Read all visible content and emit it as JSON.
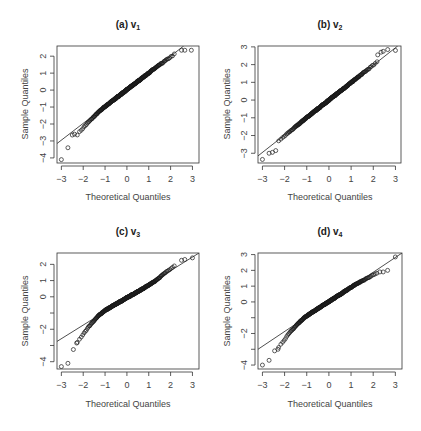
{
  "figure": {
    "panels": [
      {
        "id": "a",
        "title": "(a) v",
        "title_sub": "1",
        "xlabel": "Theoretical Quantiles",
        "ylabel": "Sample Quantiles",
        "box": {
          "x0": 57,
          "y0": 46,
          "x1": 199,
          "y1": 163
        },
        "xlim": [
          -3.2,
          3.3
        ],
        "ylim": [
          -4.3,
          2.6
        ],
        "xticks": [
          -3,
          -2,
          -1,
          0,
          1,
          2,
          3
        ],
        "xticklabels": [
          "-3",
          "-2",
          "-1",
          "0",
          "1",
          "2",
          "3"
        ],
        "yticks": [
          -4,
          -3,
          -2,
          -1,
          0,
          1,
          2
        ],
        "yticklabels": [
          "-4",
          "-3",
          "-2",
          "-1",
          "0",
          "1",
          "2"
        ],
        "line": {
          "x": [
            -3.2,
            2.6
          ],
          "y": [
            -3.15,
            2.6
          ]
        },
        "title_pos": [
          128,
          28
        ],
        "xlabel_pos": [
          128,
          200
        ],
        "ylabel_pos": [
          26,
          104
        ]
      },
      {
        "id": "b",
        "title": "(b) v",
        "title_sub": "2",
        "xlabel": "Theoretical Quantiles",
        "ylabel": "Sample Quantiles",
        "box": {
          "x0": 258,
          "y0": 46,
          "x1": 401,
          "y1": 163
        },
        "xlim": [
          -3.2,
          3.25
        ],
        "ylim": [
          -3.55,
          3.05
        ],
        "xticks": [
          -3,
          -2,
          -1,
          0,
          1,
          2,
          3
        ],
        "xticklabels": [
          "-3",
          "-2",
          "-1",
          "0",
          "1",
          "2",
          "3"
        ],
        "yticks": [
          -3,
          -2,
          -1,
          0,
          1,
          2,
          3
        ],
        "yticklabels": [
          "-3",
          "-2",
          "-1",
          "0",
          "1",
          "2",
          "3"
        ],
        "line": {
          "x": [
            -3.2,
            3.1
          ],
          "y": [
            -3.15,
            3.05
          ]
        },
        "title_pos": [
          330,
          28
        ],
        "xlabel_pos": [
          330,
          200
        ],
        "ylabel_pos": [
          228,
          104
        ]
      },
      {
        "id": "c",
        "title": "(c) v",
        "title_sub": "3",
        "xlabel": "Theoretical Quantiles",
        "ylabel": "Sample Quantiles",
        "box": {
          "x0": 57,
          "y0": 253,
          "x1": 199,
          "y1": 369
        },
        "xlim": [
          -3.2,
          3.3
        ],
        "ylim": [
          -4.45,
          2.7
        ],
        "xticks": [
          -3,
          -2,
          -1,
          0,
          1,
          2,
          3
        ],
        "xticklabels": [
          "-3",
          "-2",
          "-1",
          "0",
          "1",
          "2",
          "3"
        ],
        "yticks": [
          -4,
          -3,
          -2,
          -1,
          0,
          1,
          2
        ],
        "yticklabels": [
          "-4",
          "",
          "-2",
          "",
          "0",
          "1",
          "2"
        ],
        "line": {
          "x": [
            -3.2,
            3.3
          ],
          "y": [
            -2.75,
            2.7
          ]
        },
        "title_pos": [
          128,
          235
        ],
        "xlabel_pos": [
          128,
          407
        ],
        "ylabel_pos": [
          26,
          311
        ]
      },
      {
        "id": "d",
        "title": "(d) v",
        "title_sub": "4",
        "xlabel": "Theoretical Quantiles",
        "ylabel": "Sample Quantiles",
        "box": {
          "x0": 258,
          "y0": 253,
          "x1": 402,
          "y1": 369
        },
        "xlim": [
          -3.2,
          3.3
        ],
        "ylim": [
          -4.25,
          3.1
        ],
        "xticks": [
          -3,
          -2,
          -1,
          0,
          1,
          2,
          3
        ],
        "xticklabels": [
          "-3",
          "-2",
          "-1",
          "0",
          "1",
          "2",
          "3"
        ],
        "yticks": [
          -4,
          -3,
          -2,
          -1,
          0,
          1,
          2,
          3
        ],
        "yticklabels": [
          "-4",
          "",
          "-2",
          "",
          "0",
          "1",
          "2",
          "3"
        ],
        "line": {
          "x": [
            -3.2,
            3.3
          ],
          "y": [
            -3.0,
            3.1
          ]
        },
        "title_pos": [
          330,
          235
        ],
        "xlabel_pos": [
          330,
          407
        ],
        "ylabel_pos": [
          228,
          311
        ]
      }
    ]
  },
  "chart_data": [
    {
      "type": "scatter",
      "subtype": "qq-plot",
      "title": "(a) v₁",
      "xlabel": "Theoretical Quantiles",
      "ylabel": "Sample Quantiles",
      "xlim": [
        -3.2,
        3.3
      ],
      "ylim": [
        -4.3,
        2.6
      ],
      "xticks": [
        -3,
        -2,
        -1,
        0,
        1,
        2,
        3
      ],
      "yticks": [
        -4,
        -3,
        -2,
        -1,
        0,
        1,
        2
      ],
      "grid": false,
      "reference_line": {
        "slope": 0.99,
        "intercept": 0.02
      },
      "shape_params": {
        "lower_tail": 0.45,
        "upper_tail": -0.1,
        "mid_curve": 0.0
      },
      "outliers": [
        [
          -3.0,
          -4.1
        ],
        [
          -2.7,
          -3.4
        ],
        [
          -2.5,
          -2.65
        ],
        [
          -2.4,
          -2.6
        ],
        [
          2.5,
          2.35
        ],
        [
          2.65,
          2.35
        ],
        [
          2.95,
          2.35
        ]
      ],
      "n_points": 300
    },
    {
      "type": "scatter",
      "subtype": "qq-plot",
      "title": "(b) v₂",
      "xlabel": "Theoretical Quantiles",
      "ylabel": "Sample Quantiles",
      "xlim": [
        -3.2,
        3.25
      ],
      "ylim": [
        -3.55,
        3.05
      ],
      "xticks": [
        -3,
        -2,
        -1,
        0,
        1,
        2,
        3
      ],
      "yticks": [
        -3,
        -2,
        -1,
        0,
        1,
        2,
        3
      ],
      "grid": false,
      "reference_line": {
        "slope": 0.985,
        "intercept": 0.0
      },
      "shape_params": {
        "lower_tail": 0.1,
        "upper_tail": 0.0,
        "mid_curve": 0.0
      },
      "outliers": [
        [
          -3.0,
          -3.35
        ],
        [
          -2.7,
          -3.0
        ],
        [
          -2.55,
          -2.95
        ],
        [
          -2.4,
          -2.85
        ],
        [
          2.2,
          2.55
        ],
        [
          2.35,
          2.7
        ],
        [
          2.45,
          2.75
        ],
        [
          2.65,
          2.85
        ],
        [
          3.0,
          2.8
        ]
      ],
      "n_points": 300
    },
    {
      "type": "scatter",
      "subtype": "qq-plot",
      "title": "(c) v₃",
      "xlabel": "Theoretical Quantiles",
      "ylabel": "Sample Quantiles",
      "xlim": [
        -3.2,
        3.3
      ],
      "ylim": [
        -4.45,
        2.7
      ],
      "xticks": [
        -3,
        -2,
        -1,
        0,
        1,
        2,
        3
      ],
      "yticks": [
        -4,
        -2,
        0,
        1,
        2
      ],
      "grid": false,
      "reference_line": {
        "slope": 0.84,
        "intercept": -0.06
      },
      "shape_params": {
        "lower_tail": 1.0,
        "upper_tail": 0.35,
        "mid_curve": 0.25
      },
      "outliers": [
        [
          -3.0,
          -4.3
        ],
        [
          -2.7,
          -4.1
        ],
        [
          -2.45,
          -3.25
        ],
        [
          -2.3,
          -2.85
        ],
        [
          2.5,
          2.25
        ],
        [
          2.65,
          2.3
        ],
        [
          3.0,
          2.4
        ]
      ],
      "n_points": 300
    },
    {
      "type": "scatter",
      "subtype": "qq-plot",
      "title": "(d) v₄",
      "xlabel": "Theoretical Quantiles",
      "ylabel": "Sample Quantiles",
      "xlim": [
        -3.2,
        3.3
      ],
      "ylim": [
        -4.25,
        3.1
      ],
      "xticks": [
        -3,
        -2,
        -1,
        0,
        1,
        2,
        3
      ],
      "yticks": [
        -4,
        -2,
        0,
        1,
        2,
        3
      ],
      "grid": false,
      "reference_line": {
        "slope": 0.94,
        "intercept": 0.02
      },
      "shape_params": {
        "lower_tail": 0.9,
        "upper_tail": -0.35,
        "mid_curve": 0.15
      },
      "outliers": [
        [
          -3.0,
          -4.0
        ],
        [
          -2.7,
          -3.7
        ],
        [
          -2.45,
          -3.1
        ],
        [
          -2.3,
          -3.0
        ],
        [
          2.3,
          1.9
        ],
        [
          2.45,
          1.9
        ],
        [
          2.65,
          2.0
        ],
        [
          3.0,
          2.85
        ]
      ],
      "n_points": 300
    }
  ]
}
